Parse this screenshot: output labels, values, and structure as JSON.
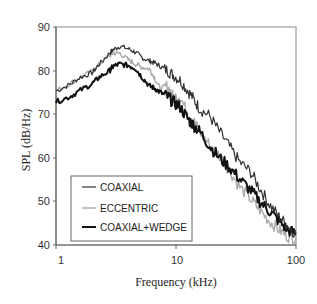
{
  "chart_data": {
    "type": "line",
    "title": "",
    "xlabel": "Frequency (kHz)",
    "ylabel": "SPL (dB/Hz)",
    "xscale": "log",
    "xlim": [
      1,
      100
    ],
    "ylim": [
      40,
      90
    ],
    "xticks": [
      1,
      10,
      100
    ],
    "xtick_labels": [
      "1",
      "10",
      "100"
    ],
    "yticks": [
      40,
      50,
      60,
      70,
      80,
      90
    ],
    "ytick_labels": [
      "40",
      "50",
      "60",
      "70",
      "80",
      "90"
    ],
    "grid": false,
    "legend_position": "lower left (inside)",
    "series": [
      {
        "name": "COAXIAL",
        "color": "#333333",
        "width": 1.2,
        "x": [
          1.0,
          1.3,
          1.6,
          2.0,
          2.3,
          2.8,
          3.0,
          3.4,
          4.0,
          4.6,
          5.2,
          6.0,
          6.6,
          7.4,
          8.5,
          9.5,
          10.8,
          12.5,
          14.0,
          15.8,
          19.1,
          23.0,
          28.0,
          34.0,
          42.0,
          50.0,
          60.0,
          72.0,
          85.0,
          100.0
        ],
        "y": [
          75.3,
          76.8,
          78.5,
          79.5,
          81.5,
          84.0,
          84.8,
          85.6,
          85.0,
          84.2,
          83.0,
          82.2,
          81.8,
          81.0,
          80.0,
          79.0,
          77.8,
          75.5,
          73.5,
          71.2,
          69.6,
          66.0,
          62.5,
          59.0,
          56.7,
          53.0,
          49.4,
          46.5,
          44.5,
          42.5
        ]
      },
      {
        "name": "ECCENTRIC",
        "color": "#aaaaaa",
        "width": 1.4,
        "x": [
          1.0,
          1.3,
          1.6,
          2.0,
          2.3,
          2.8,
          3.0,
          3.4,
          4.0,
          4.6,
          5.2,
          6.0,
          6.6,
          7.4,
          8.5,
          9.5,
          10.8,
          12.5,
          14.0,
          15.8,
          19.1,
          23.0,
          28.0,
          34.0,
          42.0,
          50.0,
          60.0,
          72.0,
          85.0,
          100.0
        ],
        "y": [
          75.3,
          77.0,
          78.5,
          79.8,
          81.5,
          83.5,
          84.0,
          84.0,
          82.5,
          81.5,
          80.8,
          80.4,
          78.5,
          75.8,
          76.5,
          74.0,
          74.2,
          70.0,
          68.5,
          66.0,
          63.0,
          60.5,
          57.0,
          53.3,
          50.5,
          48.0,
          45.5,
          43.5,
          42.0,
          41.5
        ]
      },
      {
        "name": "COAXIAL+WEDGE",
        "color": "#111111",
        "width": 2.0,
        "x": [
          1.0,
          1.3,
          1.6,
          2.0,
          2.3,
          2.8,
          3.0,
          3.4,
          4.0,
          4.6,
          5.2,
          6.0,
          6.6,
          7.4,
          8.5,
          9.5,
          10.8,
          12.5,
          14.0,
          15.8,
          19.1,
          23.0,
          28.0,
          34.0,
          42.0,
          50.0,
          60.0,
          72.0,
          85.0,
          100.0
        ],
        "y": [
          72.8,
          74.0,
          75.5,
          77.0,
          78.5,
          80.0,
          81.0,
          81.5,
          81.2,
          80.5,
          78.5,
          76.5,
          76.0,
          75.0,
          74.0,
          72.8,
          71.7,
          69.0,
          67.5,
          66.0,
          62.7,
          60.0,
          57.8,
          55.1,
          52.5,
          50.0,
          47.8,
          45.5,
          43.5,
          42.5
        ]
      }
    ]
  },
  "legend": {
    "items": [
      {
        "label": "COAXIAL"
      },
      {
        "label": "ECCENTRIC"
      },
      {
        "label": "COAXIAL+WEDGE"
      }
    ]
  },
  "axes": {
    "xlabel": "Frequency (kHz)",
    "ylabel": "SPL (dB/Hz)",
    "xtick_labels": [
      "1",
      "10",
      "100"
    ],
    "ytick_labels": [
      "40",
      "50",
      "60",
      "70",
      "80",
      "90"
    ]
  }
}
